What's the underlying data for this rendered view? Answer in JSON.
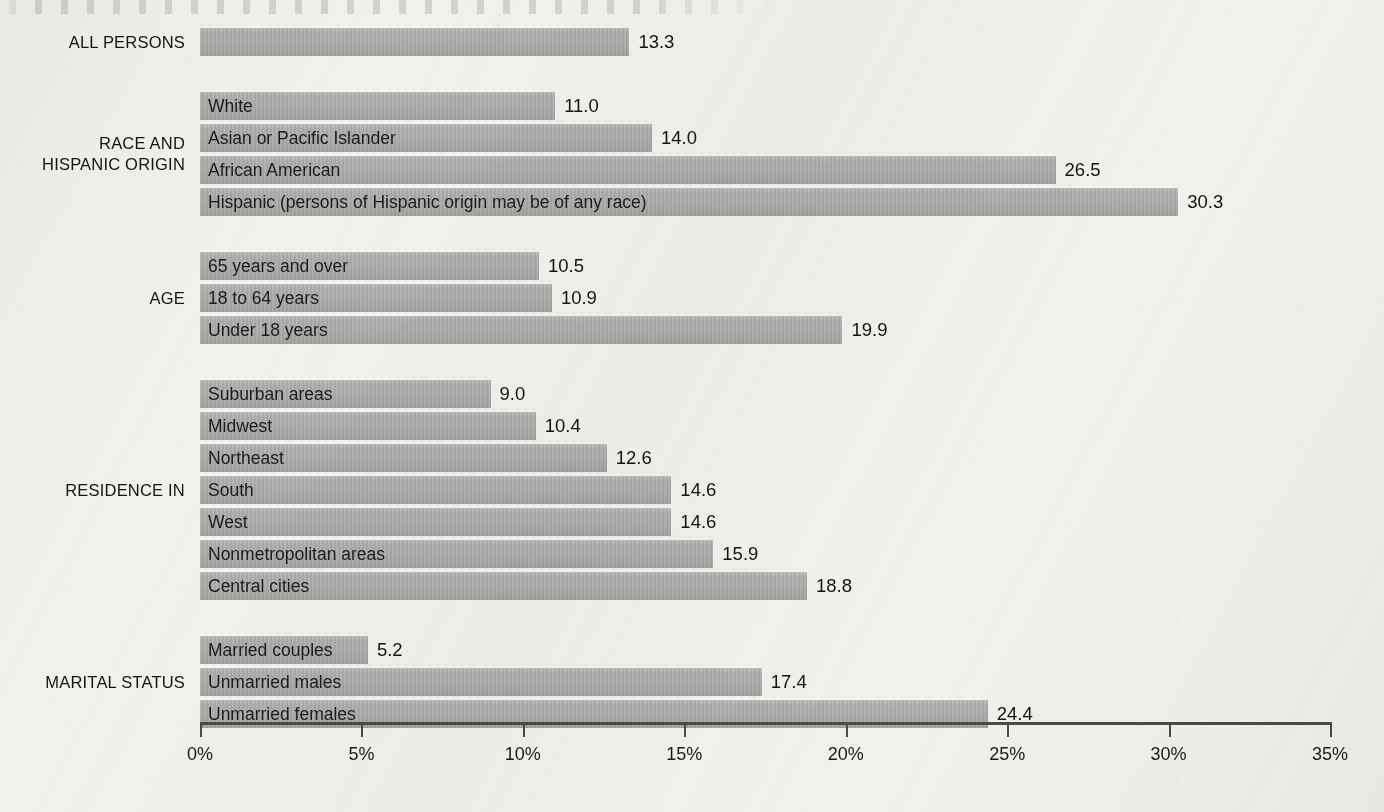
{
  "chart_data": {
    "type": "bar",
    "orientation": "horizontal",
    "title": "",
    "xlabel": "",
    "ylabel": "",
    "xlim": [
      0,
      35
    ],
    "xtick_labels": [
      "0%",
      "5%",
      "10%",
      "15%",
      "20%",
      "25%",
      "30%",
      "35%"
    ],
    "xticks": [
      0,
      5,
      10,
      15,
      20,
      25,
      30,
      35
    ],
    "grid": false,
    "legend": "none",
    "bar_color": "#adadad",
    "background_color": "#f2f0eb",
    "groups": [
      {
        "label": "ALL PERSONS",
        "bars": [
          {
            "label": "",
            "value": 13.3,
            "value_text": "13.3"
          }
        ]
      },
      {
        "label": "RACE AND\nHISPANIC ORIGIN",
        "bars": [
          {
            "label": "White",
            "value": 11.0,
            "value_text": "11.0"
          },
          {
            "label": "Asian or Pacific Islander",
            "value": 14.0,
            "value_text": "14.0"
          },
          {
            "label": "African American",
            "value": 26.5,
            "value_text": "26.5"
          },
          {
            "label": "Hispanic (persons of Hispanic origin may be of any race)",
            "value": 30.3,
            "value_text": "30.3"
          }
        ]
      },
      {
        "label": "AGE",
        "bars": [
          {
            "label": "65 years and over",
            "value": 10.5,
            "value_text": "10.5"
          },
          {
            "label": "18 to 64 years",
            "value": 10.9,
            "value_text": "10.9"
          },
          {
            "label": "Under 18 years",
            "value": 19.9,
            "value_text": "19.9"
          }
        ]
      },
      {
        "label": "RESIDENCE IN",
        "bars": [
          {
            "label": "Suburban areas",
            "value": 9.0,
            "value_text": "9.0"
          },
          {
            "label": "Midwest",
            "value": 10.4,
            "value_text": "10.4"
          },
          {
            "label": "Northeast",
            "value": 12.6,
            "value_text": "12.6"
          },
          {
            "label": "South",
            "value": 14.6,
            "value_text": "14.6"
          },
          {
            "label": "West",
            "value": 14.6,
            "value_text": "14.6"
          },
          {
            "label": "Nonmetropolitan areas",
            "value": 15.9,
            "value_text": "15.9"
          },
          {
            "label": "Central cities",
            "value": 18.8,
            "value_text": "18.8"
          }
        ]
      },
      {
        "label": "MARITAL STATUS",
        "bars": [
          {
            "label": "Married couples",
            "value": 5.2,
            "value_text": "5.2"
          },
          {
            "label": "Unmarried males",
            "value": 17.4,
            "value_text": "17.4"
          },
          {
            "label": "Unmarried females",
            "value": 24.4,
            "value_text": "24.4"
          }
        ]
      }
    ]
  },
  "layout": {
    "plot_left_px": 200,
    "plot_right_px": 1330,
    "axis_y_px": 722,
    "row_height_px": 28,
    "row_gap_px": 4,
    "group_gap_px": 32,
    "first_row_top_px": 28
  }
}
